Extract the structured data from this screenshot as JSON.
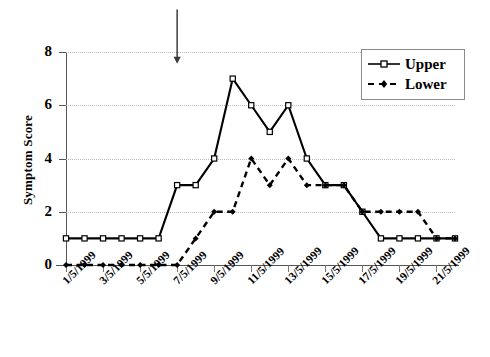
{
  "chart_data": {
    "type": "line",
    "title": "",
    "xlabel": "",
    "ylabel": "Symptom Score",
    "ylim": [
      0,
      8
    ],
    "yticks": [
      0,
      2,
      4,
      6,
      8
    ],
    "grid": true,
    "legend_position": "top-right",
    "x": [
      "1/5/1999",
      "2/5/1999",
      "3/5/1999",
      "4/5/1999",
      "5/5/1999",
      "6/5/1999",
      "7/5/1999",
      "8/5/1999",
      "9/5/1999",
      "10/5/1999",
      "11/5/1999",
      "12/5/1999",
      "13/5/1999",
      "14/5/1999",
      "15/5/1999",
      "16/5/1999",
      "17/5/1999",
      "18/5/1999",
      "19/5/1999",
      "20/5/1999",
      "21/5/1999",
      "22/5/1999"
    ],
    "xtick_labels": [
      "1/5/1999",
      "3/5/1999",
      "5/5/1999",
      "7/5/1999",
      "9/5/1999",
      "11/5/1999",
      "13/5/1999",
      "15/5/1999",
      "17/5/1999",
      "19/5/1999",
      "21/5/1999"
    ],
    "xtick_indices": [
      0,
      2,
      4,
      6,
      8,
      10,
      12,
      14,
      16,
      18,
      20
    ],
    "series": [
      {
        "name": "Upper",
        "style": "solid",
        "marker": "square",
        "color": "#000000",
        "values": [
          1,
          1,
          1,
          1,
          1,
          1,
          3,
          3,
          4,
          7,
          6,
          5,
          6,
          4,
          3,
          3,
          2,
          1,
          1,
          1,
          1,
          1
        ]
      },
      {
        "name": "Lower",
        "style": "dashed",
        "marker": "diamond",
        "color": "#000000",
        "values": [
          0,
          0,
          0,
          0,
          0,
          0,
          0,
          1,
          2,
          2,
          4,
          3,
          4,
          3,
          3,
          3,
          2,
          2,
          2,
          2,
          1,
          1
        ]
      }
    ],
    "annotations": [
      {
        "type": "down-arrow",
        "x_index": 6,
        "x_label": "7/5/1999",
        "y_from": 9.6,
        "y_to": 7.6
      }
    ]
  },
  "legend": {
    "items": [
      {
        "label": "Upper"
      },
      {
        "label": "Lower"
      }
    ]
  },
  "axes": {
    "y_title": "Symptom Score",
    "y_labels": [
      "0",
      "2",
      "4",
      "6",
      "8"
    ]
  },
  "colors": {
    "series_line": "#000000",
    "gridline": "#b9b9b9",
    "axis": "#555555",
    "legend_border": "#8a8a8a",
    "background": "#ffffff"
  }
}
